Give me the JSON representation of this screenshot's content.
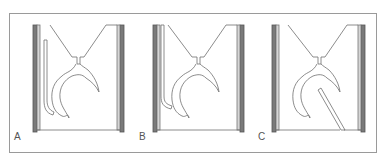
{
  "figure": {
    "panels": [
      {
        "id": "A",
        "label": "A",
        "rod_state": "lowered-straight"
      },
      {
        "id": "B",
        "label": "B",
        "rod_state": "raised-bent"
      },
      {
        "id": "C",
        "label": "C",
        "rod_state": "diagonal-detached"
      }
    ],
    "colors": {
      "frame": "#8a8a8a",
      "line": "#6e6e6e",
      "wall_dark": "#7a7a7a",
      "wall_light": "#bdbdbd",
      "background": "#ffffff"
    }
  }
}
